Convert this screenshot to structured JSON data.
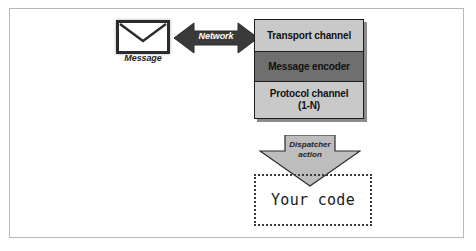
{
  "diagram": {
    "message": {
      "icon": "envelope-icon",
      "label": "Message"
    },
    "network": {
      "icon": "double-arrow-horizontal-icon",
      "label": "Network"
    },
    "stack": [
      {
        "label": "Transport channel",
        "shade": "#c9c9c9"
      },
      {
        "label": "Message encoder",
        "shade": "#6f6f6f"
      },
      {
        "label": "Protocol channel\n(1-N)",
        "line1": "Protocol channel",
        "line2": "(1-N)",
        "shade": "#c9c9c9"
      }
    ],
    "dispatcher": {
      "icon": "arrow-down-icon",
      "line1": "Dispatcher",
      "line2": "action"
    },
    "your_code": {
      "label": "Your code"
    },
    "colors": {
      "frame_border": "#b9b9b9",
      "box_light": "#c9c9c9",
      "box_dark": "#6f6f6f",
      "arrow_dark": "#3a3a3a",
      "arrow_light": "#bdbdbd",
      "outline": "#1d1d1d"
    }
  }
}
